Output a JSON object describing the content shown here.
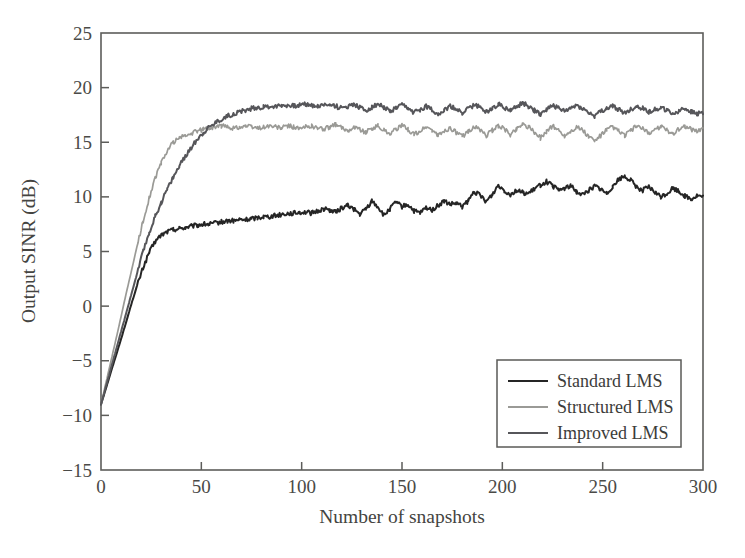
{
  "chart_data": {
    "type": "line",
    "title": "",
    "xlabel": "Number of snapshots",
    "ylabel": "Output SINR (dB)",
    "xlim": [
      0,
      300
    ],
    "ylim": [
      -15,
      25
    ],
    "xticks": [
      0,
      50,
      100,
      150,
      200,
      250,
      300
    ],
    "yticks": [
      -15,
      -10,
      -5,
      0,
      5,
      10,
      15,
      20,
      25
    ],
    "xtick_labels": [
      "0",
      "50",
      "100",
      "150",
      "200",
      "250",
      "300"
    ],
    "ytick_labels": [
      "-15",
      "-10",
      "-5",
      "0",
      "5",
      "10",
      "15",
      "20",
      "25"
    ],
    "grid": false,
    "legend_position": "lower right",
    "series": [
      {
        "name": "Standard LMS",
        "color": "#252525",
        "width": 2.0,
        "x": [
          0,
          3,
          6,
          9,
          12,
          15,
          18,
          21,
          24,
          27,
          30,
          33,
          36,
          39,
          42,
          45,
          48,
          51,
          54,
          57,
          60,
          63,
          66,
          69,
          72,
          75,
          78,
          81,
          84,
          87,
          90,
          93,
          96,
          99,
          102,
          105,
          108,
          111,
          114,
          117,
          120,
          123,
          126,
          129,
          132,
          135,
          138,
          141,
          144,
          147,
          150,
          153,
          156,
          159,
          162,
          165,
          168,
          171,
          174,
          177,
          180,
          183,
          186,
          189,
          192,
          195,
          198,
          201,
          204,
          207,
          210,
          213,
          216,
          219,
          222,
          225,
          228,
          231,
          234,
          237,
          240,
          243,
          246,
          249,
          252,
          255,
          258,
          261,
          264,
          267,
          270,
          273,
          276,
          279,
          282,
          285,
          288,
          291,
          294,
          297,
          300
        ],
        "y": [
          -9.0,
          -7.2,
          -5.4,
          -3.6,
          -1.8,
          0.1,
          1.9,
          3.5,
          4.9,
          5.9,
          6.5,
          6.8,
          7.0,
          7.1,
          7.2,
          7.3,
          7.4,
          7.5,
          7.5,
          7.6,
          7.7,
          7.8,
          7.8,
          7.9,
          7.9,
          8.0,
          8.1,
          8.2,
          8.2,
          8.3,
          8.4,
          8.5,
          8.5,
          8.6,
          8.6,
          8.5,
          8.7,
          8.9,
          8.8,
          8.6,
          9.0,
          9.2,
          8.9,
          8.4,
          8.9,
          9.6,
          9.1,
          8.3,
          8.9,
          9.5,
          9.1,
          9.3,
          8.7,
          8.5,
          9.0,
          8.8,
          9.2,
          9.6,
          9.3,
          9.4,
          9.1,
          9.6,
          10.5,
          10.1,
          9.6,
          10.2,
          11.1,
          10.6,
          10.2,
          10.6,
          10.4,
          10.3,
          10.7,
          11.1,
          11.4,
          11.0,
          10.6,
          10.8,
          11.0,
          10.5,
          10.2,
          10.6,
          11.0,
          10.7,
          10.3,
          11.0,
          11.6,
          11.9,
          11.5,
          10.9,
          10.6,
          10.9,
          10.4,
          10.0,
          10.3,
          10.8,
          10.5,
          10.1,
          9.8,
          10.1,
          10.0
        ]
      },
      {
        "name": "Structured LMS",
        "color": "#9a9a96",
        "width": 1.7,
        "x": [
          0,
          3,
          6,
          9,
          12,
          15,
          18,
          21,
          24,
          27,
          30,
          33,
          36,
          39,
          42,
          45,
          48,
          51,
          54,
          57,
          60,
          63,
          66,
          69,
          72,
          75,
          78,
          81,
          84,
          87,
          90,
          93,
          96,
          99,
          102,
          105,
          108,
          111,
          114,
          117,
          120,
          123,
          126,
          129,
          132,
          135,
          138,
          141,
          144,
          147,
          150,
          153,
          156,
          159,
          162,
          165,
          168,
          171,
          174,
          177,
          180,
          183,
          186,
          189,
          192,
          195,
          198,
          201,
          204,
          207,
          210,
          213,
          216,
          219,
          222,
          225,
          228,
          231,
          234,
          237,
          240,
          243,
          246,
          249,
          252,
          255,
          258,
          261,
          264,
          267,
          270,
          273,
          276,
          279,
          282,
          285,
          288,
          291,
          294,
          297,
          300
        ],
        "y": [
          -9.0,
          -6.6,
          -4.2,
          -1.8,
          0.7,
          3.1,
          5.5,
          7.8,
          9.9,
          11.7,
          13.1,
          14.2,
          15.0,
          15.4,
          15.6,
          15.8,
          16.0,
          16.2,
          16.3,
          16.4,
          16.5,
          16.4,
          16.3,
          16.4,
          16.5,
          16.4,
          16.3,
          16.4,
          16.5,
          16.4,
          16.3,
          16.5,
          16.4,
          16.2,
          16.4,
          16.5,
          16.3,
          16.2,
          16.4,
          16.6,
          16.3,
          16.1,
          16.4,
          16.2,
          15.9,
          16.3,
          16.5,
          16.1,
          15.8,
          16.2,
          16.5,
          16.2,
          15.7,
          16.0,
          16.4,
          16.1,
          15.6,
          16.0,
          16.3,
          15.9,
          15.5,
          16.0,
          16.4,
          16.1,
          15.6,
          16.1,
          16.5,
          16.2,
          15.7,
          16.2,
          16.7,
          16.4,
          15.9,
          15.4,
          16.0,
          16.5,
          16.1,
          15.6,
          16.0,
          16.4,
          16.1,
          15.5,
          15.1,
          15.6,
          16.1,
          16.4,
          16.0,
          15.6,
          16.1,
          16.5,
          16.2,
          15.8,
          16.2,
          16.4,
          16.1,
          15.8,
          16.2,
          16.5,
          16.2,
          16.0,
          16.3
        ]
      },
      {
        "name": "Improved LMS",
        "color": "#56565a",
        "width": 2.0,
        "x": [
          0,
          3,
          6,
          9,
          12,
          15,
          18,
          21,
          24,
          27,
          30,
          33,
          36,
          39,
          42,
          45,
          48,
          51,
          54,
          57,
          60,
          63,
          66,
          69,
          72,
          75,
          78,
          81,
          84,
          87,
          90,
          93,
          96,
          99,
          102,
          105,
          108,
          111,
          114,
          117,
          120,
          123,
          126,
          129,
          132,
          135,
          138,
          141,
          144,
          147,
          150,
          153,
          156,
          159,
          162,
          165,
          168,
          171,
          174,
          177,
          180,
          183,
          186,
          189,
          192,
          195,
          198,
          201,
          204,
          207,
          210,
          213,
          216,
          219,
          222,
          225,
          228,
          231,
          234,
          237,
          240,
          243,
          246,
          249,
          252,
          255,
          258,
          261,
          264,
          267,
          270,
          273,
          276,
          279,
          282,
          285,
          288,
          291,
          294,
          297,
          300
        ],
        "y": [
          -9.0,
          -7.0,
          -5.0,
          -3.0,
          -1.0,
          1.0,
          3.0,
          5.0,
          6.7,
          8.2,
          9.5,
          10.7,
          11.8,
          12.8,
          13.7,
          14.5,
          15.3,
          15.9,
          16.4,
          16.8,
          17.1,
          17.4,
          17.6,
          17.8,
          17.9,
          18.1,
          18.2,
          18.2,
          18.3,
          18.3,
          18.4,
          18.4,
          18.3,
          18.4,
          18.5,
          18.4,
          18.3,
          18.4,
          18.5,
          18.3,
          18.1,
          18.3,
          18.5,
          18.2,
          17.9,
          18.2,
          18.5,
          18.2,
          17.8,
          18.1,
          18.4,
          18.1,
          17.7,
          18.0,
          18.3,
          18.0,
          17.6,
          17.9,
          18.3,
          18.0,
          17.7,
          18.1,
          18.4,
          18.2,
          17.8,
          18.1,
          18.5,
          18.2,
          17.9,
          18.2,
          18.6,
          18.3,
          17.9,
          17.6,
          18.0,
          18.4,
          18.1,
          17.8,
          18.1,
          18.4,
          18.1,
          17.7,
          17.4,
          17.8,
          18.1,
          18.3,
          18.0,
          17.7,
          18.0,
          18.3,
          18.1,
          17.8,
          18.0,
          18.2,
          17.9,
          17.6,
          17.9,
          18.1,
          17.8,
          17.6,
          17.7
        ]
      }
    ]
  },
  "legend": {
    "items": [
      {
        "label": "Standard LMS",
        "color": "#252525",
        "width": 2.2
      },
      {
        "label": "Structured LMS",
        "color": "#9a9a96",
        "width": 1.7
      },
      {
        "label": "Improved LMS",
        "color": "#56565a",
        "width": 2.2
      }
    ]
  },
  "axes": {
    "x_title": "Number of snapshots",
    "y_title": "Output SINR (dB)"
  }
}
